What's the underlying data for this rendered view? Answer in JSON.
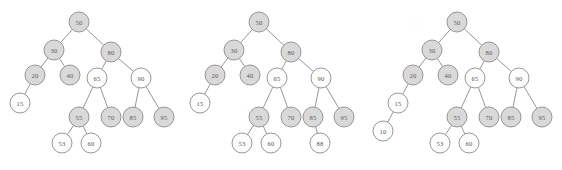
{
  "figure": {
    "caption": "",
    "background_color": "#ffffff",
    "node_shaded_color": "#d9d9d9",
    "node_plain_color": "#fdfdfd",
    "node_stroke_color": "#8c8c8c",
    "edge_color": "#8a8a8a",
    "label_color": "#5a5a5a",
    "node_radius": 10
  },
  "trees": [
    {
      "name": "tree-left",
      "nodes": [
        {
          "id": "t1-50",
          "label": "50",
          "x": 79,
          "y": 22,
          "shaded": true
        },
        {
          "id": "t1-30",
          "label": "30",
          "x": 54,
          "y": 50,
          "shaded": true
        },
        {
          "id": "t1-80",
          "label": "80",
          "x": 111,
          "y": 52,
          "shaded": true
        },
        {
          "id": "t1-20",
          "label": "20",
          "x": 35,
          "y": 75,
          "shaded": true
        },
        {
          "id": "t1-40",
          "label": "40",
          "x": 70,
          "y": 75,
          "shaded": true
        },
        {
          "id": "t1-65",
          "label": "65",
          "x": 97,
          "y": 78,
          "shaded": false
        },
        {
          "id": "t1-90",
          "label": "90",
          "x": 141,
          "y": 78,
          "shaded": false
        },
        {
          "id": "t1-15",
          "label": "15",
          "x": 20,
          "y": 103,
          "shaded": false
        },
        {
          "id": "t1-55",
          "label": "55",
          "x": 79,
          "y": 117,
          "shaded": true
        },
        {
          "id": "t1-70",
          "label": "70",
          "x": 111,
          "y": 117,
          "shaded": true
        },
        {
          "id": "t1-85",
          "label": "85",
          "x": 133,
          "y": 117,
          "shaded": true
        },
        {
          "id": "t1-95",
          "label": "95",
          "x": 164,
          "y": 117,
          "shaded": true
        },
        {
          "id": "t1-53",
          "label": "53",
          "x": 62,
          "y": 143,
          "shaded": false
        },
        {
          "id": "t1-60",
          "label": "60",
          "x": 91,
          "y": 143,
          "shaded": false
        }
      ],
      "edges": [
        [
          "t1-50",
          "t1-30"
        ],
        [
          "t1-50",
          "t1-80"
        ],
        [
          "t1-30",
          "t1-20"
        ],
        [
          "t1-30",
          "t1-40"
        ],
        [
          "t1-80",
          "t1-65"
        ],
        [
          "t1-80",
          "t1-90"
        ],
        [
          "t1-20",
          "t1-15"
        ],
        [
          "t1-65",
          "t1-55"
        ],
        [
          "t1-65",
          "t1-70"
        ],
        [
          "t1-90",
          "t1-85"
        ],
        [
          "t1-90",
          "t1-95"
        ],
        [
          "t1-55",
          "t1-53"
        ],
        [
          "t1-55",
          "t1-60"
        ]
      ]
    },
    {
      "name": "tree-middle",
      "nodes": [
        {
          "id": "t2-50",
          "label": "50",
          "x": 259,
          "y": 22,
          "shaded": true
        },
        {
          "id": "t2-30",
          "label": "30",
          "x": 234,
          "y": 50,
          "shaded": true
        },
        {
          "id": "t2-80",
          "label": "80",
          "x": 291,
          "y": 52,
          "shaded": true
        },
        {
          "id": "t2-20",
          "label": "20",
          "x": 215,
          "y": 75,
          "shaded": true
        },
        {
          "id": "t2-40",
          "label": "40",
          "x": 250,
          "y": 75,
          "shaded": true
        },
        {
          "id": "t2-65",
          "label": "65",
          "x": 277,
          "y": 78,
          "shaded": false
        },
        {
          "id": "t2-90",
          "label": "90",
          "x": 321,
          "y": 78,
          "shaded": false
        },
        {
          "id": "t2-15",
          "label": "15",
          "x": 200,
          "y": 103,
          "shaded": false
        },
        {
          "id": "t2-55",
          "label": "55",
          "x": 259,
          "y": 117,
          "shaded": true
        },
        {
          "id": "t2-70",
          "label": "70",
          "x": 291,
          "y": 117,
          "shaded": true
        },
        {
          "id": "t2-85",
          "label": "85",
          "x": 313,
          "y": 117,
          "shaded": true
        },
        {
          "id": "t2-95",
          "label": "95",
          "x": 344,
          "y": 117,
          "shaded": true
        },
        {
          "id": "t2-53",
          "label": "53",
          "x": 242,
          "y": 143,
          "shaded": false
        },
        {
          "id": "t2-60",
          "label": "60",
          "x": 271,
          "y": 143,
          "shaded": false
        },
        {
          "id": "t2-88",
          "label": "88",
          "x": 320,
          "y": 143,
          "shaded": false
        }
      ],
      "edges": [
        [
          "t2-50",
          "t2-30"
        ],
        [
          "t2-50",
          "t2-80"
        ],
        [
          "t2-30",
          "t2-20"
        ],
        [
          "t2-30",
          "t2-40"
        ],
        [
          "t2-80",
          "t2-65"
        ],
        [
          "t2-80",
          "t2-90"
        ],
        [
          "t2-20",
          "t2-15"
        ],
        [
          "t2-65",
          "t2-55"
        ],
        [
          "t2-65",
          "t2-70"
        ],
        [
          "t2-90",
          "t2-85"
        ],
        [
          "t2-90",
          "t2-95"
        ],
        [
          "t2-55",
          "t2-53"
        ],
        [
          "t2-55",
          "t2-60"
        ],
        [
          "t2-85",
          "t2-88"
        ]
      ]
    },
    {
      "name": "tree-right",
      "nodes": [
        {
          "id": "t3-50",
          "label": "50",
          "x": 457,
          "y": 22,
          "shaded": true
        },
        {
          "id": "t3-30",
          "label": "30",
          "x": 432,
          "y": 50,
          "shaded": true
        },
        {
          "id": "t3-80",
          "label": "80",
          "x": 489,
          "y": 52,
          "shaded": true
        },
        {
          "id": "t3-20",
          "label": "20",
          "x": 413,
          "y": 75,
          "shaded": true
        },
        {
          "id": "t3-40",
          "label": "40",
          "x": 448,
          "y": 75,
          "shaded": true
        },
        {
          "id": "t3-65",
          "label": "65",
          "x": 475,
          "y": 78,
          "shaded": false
        },
        {
          "id": "t3-90",
          "label": "90",
          "x": 519,
          "y": 78,
          "shaded": false
        },
        {
          "id": "t3-15",
          "label": "15",
          "x": 398,
          "y": 103,
          "shaded": false
        },
        {
          "id": "t3-55",
          "label": "55",
          "x": 457,
          "y": 117,
          "shaded": true
        },
        {
          "id": "t3-70",
          "label": "70",
          "x": 489,
          "y": 117,
          "shaded": true
        },
        {
          "id": "t3-85",
          "label": "85",
          "x": 511,
          "y": 117,
          "shaded": true
        },
        {
          "id": "t3-95",
          "label": "95",
          "x": 542,
          "y": 117,
          "shaded": true
        },
        {
          "id": "t3-10",
          "label": "10",
          "x": 383,
          "y": 131,
          "shaded": false
        },
        {
          "id": "t3-53",
          "label": "53",
          "x": 440,
          "y": 143,
          "shaded": false
        },
        {
          "id": "t3-60",
          "label": "60",
          "x": 469,
          "y": 143,
          "shaded": false
        }
      ],
      "edges": [
        [
          "t3-50",
          "t3-30"
        ],
        [
          "t3-50",
          "t3-80"
        ],
        [
          "t3-30",
          "t3-20"
        ],
        [
          "t3-30",
          "t3-40"
        ],
        [
          "t3-80",
          "t3-65"
        ],
        [
          "t3-80",
          "t3-90"
        ],
        [
          "t3-20",
          "t3-15"
        ],
        [
          "t3-15",
          "t3-10"
        ],
        [
          "t3-65",
          "t3-55"
        ],
        [
          "t3-65",
          "t3-70"
        ],
        [
          "t3-90",
          "t3-85"
        ],
        [
          "t3-90",
          "t3-95"
        ],
        [
          "t3-55",
          "t3-53"
        ],
        [
          "t3-55",
          "t3-60"
        ]
      ]
    }
  ]
}
